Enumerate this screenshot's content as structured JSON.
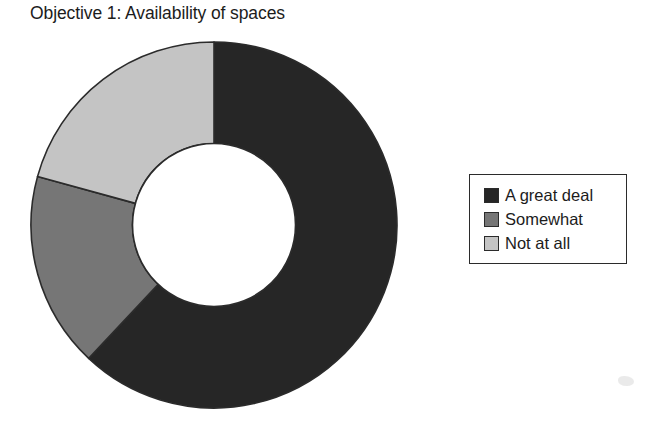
{
  "chart_data": {
    "type": "pie",
    "variant": "donut",
    "title": "Objective 1: Availability of spaces",
    "subtitle": "",
    "xlabel": "",
    "ylabel": "",
    "categories": [
      "A great deal",
      "Somewhat",
      "Not at all"
    ],
    "values": [
      62.0,
      17.3,
      20.7
    ],
    "value_unit": "percent",
    "angles_deg": [
      223.2,
      62.2,
      74.6
    ],
    "start_angle_deg": 0,
    "direction": "clockwise",
    "colors": [
      "#262626",
      "#767676",
      "#c4c4c4"
    ],
    "slice_border_color": "#2b2b2b",
    "inner_radius_ratio": 0.445,
    "grid": false,
    "data_labels_shown": false,
    "legend": {
      "position": "right",
      "bordered": true,
      "entries": [
        {
          "label": "A great deal",
          "color": "#262626"
        },
        {
          "label": "Somewhat",
          "color": "#767676"
        },
        {
          "label": "Not at all",
          "color": "#c4c4c4"
        }
      ]
    }
  },
  "figure": {
    "title": "Objective 1: Availability of spaces",
    "background": "#ffffff"
  },
  "donut": {
    "center_x": 184,
    "center_y": 184,
    "outer_radius": 183,
    "inner_radius": 81.5,
    "hole_fill": "#ffffff",
    "slices": [
      {
        "name": "A great deal",
        "start_deg": 0.0,
        "end_deg": 223.2,
        "color": "#262626",
        "percent": 62.0
      },
      {
        "name": "Somewhat",
        "start_deg": 223.2,
        "end_deg": 285.4,
        "color": "#767676",
        "percent": 17.3
      },
      {
        "name": "Not at all",
        "start_deg": 285.4,
        "end_deg": 360.0,
        "color": "#c4c4c4",
        "percent": 20.7
      }
    ]
  },
  "legend": {
    "entries": [
      {
        "label": "A great deal",
        "color": "#262626"
      },
      {
        "label": "Somewhat",
        "color": "#767676"
      },
      {
        "label": "Not at all",
        "color": "#c4c4c4"
      }
    ]
  }
}
